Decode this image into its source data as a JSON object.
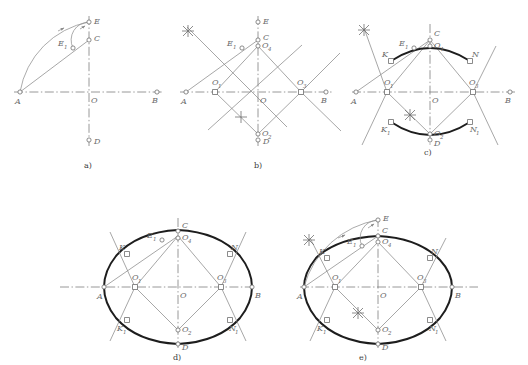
{
  "figure": {
    "panels": [
      {
        "id": "a",
        "caption": "a)",
        "description": "Step 1: major axis AB, minor axis CD, hypotenuse AC, arc CE and arc E1",
        "labels": [
          {
            "name": "A",
            "text": "A"
          },
          {
            "name": "B",
            "text": "B"
          },
          {
            "name": "C",
            "text": "C"
          },
          {
            "name": "D",
            "text": "D"
          },
          {
            "name": "E",
            "text": "E"
          },
          {
            "name": "E1",
            "text": "E",
            "sub": "1"
          },
          {
            "name": "O",
            "text": "O"
          }
        ]
      },
      {
        "id": "b",
        "caption": "b)",
        "description": "Step 2: perpendicular bisector of AE1 locates centres O1, O2, O3, O4",
        "labels": [
          {
            "name": "A",
            "text": "A"
          },
          {
            "name": "B",
            "text": "B"
          },
          {
            "name": "C",
            "text": "C"
          },
          {
            "name": "D",
            "text": "D"
          },
          {
            "name": "E",
            "text": "E"
          },
          {
            "name": "E1",
            "text": "E",
            "sub": "1"
          },
          {
            "name": "O",
            "text": "O"
          },
          {
            "name": "O1",
            "text": "O",
            "sub": "1"
          },
          {
            "name": "O2",
            "text": "O",
            "sub": "2"
          },
          {
            "name": "O3",
            "text": "O",
            "sub": "3"
          },
          {
            "name": "O4",
            "text": "O",
            "sub": "4"
          }
        ]
      },
      {
        "id": "c",
        "caption": "c)",
        "description": "Step 3: arcs K-C-N and K1-D-N1 drawn from centres O4 and O2",
        "labels": [
          {
            "name": "A",
            "text": "A"
          },
          {
            "name": "B",
            "text": "B"
          },
          {
            "name": "C",
            "text": "C"
          },
          {
            "name": "D",
            "text": "D"
          },
          {
            "name": "E1",
            "text": "E",
            "sub": "1"
          },
          {
            "name": "O",
            "text": "O"
          },
          {
            "name": "O1",
            "text": "O",
            "sub": "1"
          },
          {
            "name": "O2",
            "text": "O",
            "sub": "2"
          },
          {
            "name": "O3",
            "text": "O",
            "sub": "3"
          },
          {
            "name": "O4",
            "text": "O",
            "sub": "4"
          },
          {
            "name": "K",
            "text": "K"
          },
          {
            "name": "K1",
            "text": "K",
            "sub": "1"
          },
          {
            "name": "N",
            "text": "N"
          },
          {
            "name": "N1",
            "text": "N",
            "sub": "1"
          }
        ]
      },
      {
        "id": "d",
        "caption": "d)",
        "description": "Step 4: side arcs K-A-K1 and N-B-N1 complete the oval",
        "labels": [
          {
            "name": "A",
            "text": "A"
          },
          {
            "name": "B",
            "text": "B"
          },
          {
            "name": "C",
            "text": "C"
          },
          {
            "name": "D",
            "text": "D"
          },
          {
            "name": "E1",
            "text": "E",
            "sub": "1"
          },
          {
            "name": "O",
            "text": "O"
          },
          {
            "name": "O1",
            "text": "O",
            "sub": "1"
          },
          {
            "name": "O2",
            "text": "O",
            "sub": "2"
          },
          {
            "name": "O3",
            "text": "O",
            "sub": "3"
          },
          {
            "name": "O4",
            "text": "O",
            "sub": "4"
          },
          {
            "name": "K",
            "text": "K"
          },
          {
            "name": "K1",
            "text": "K",
            "sub": "1"
          },
          {
            "name": "N",
            "text": "N"
          },
          {
            "name": "N1",
            "text": "N",
            "sub": "1"
          }
        ]
      },
      {
        "id": "e",
        "caption": "e)",
        "description": "Finished oval with the original setting-out arcs retained",
        "labels": [
          {
            "name": "A",
            "text": "A"
          },
          {
            "name": "B",
            "text": "B"
          },
          {
            "name": "C",
            "text": "C"
          },
          {
            "name": "D",
            "text": "D"
          },
          {
            "name": "E",
            "text": "E"
          },
          {
            "name": "E1",
            "text": "E",
            "sub": "1"
          },
          {
            "name": "O",
            "text": "O"
          },
          {
            "name": "O1",
            "text": "O",
            "sub": "1"
          },
          {
            "name": "O2",
            "text": "O",
            "sub": "2"
          },
          {
            "name": "O3",
            "text": "O",
            "sub": "3"
          },
          {
            "name": "O4",
            "text": "O",
            "sub": "4"
          },
          {
            "name": "K",
            "text": "K"
          },
          {
            "name": "K1",
            "text": "K",
            "sub": "1"
          },
          {
            "name": "N",
            "text": "N"
          },
          {
            "name": "N1",
            "text": "N",
            "sub": "1"
          }
        ]
      }
    ],
    "colors": {
      "ink_heavy": "#1d1d1d",
      "ink_construction": "#8a8a8a",
      "axis": "#7d7d7d",
      "paper": "#ffffff"
    }
  }
}
